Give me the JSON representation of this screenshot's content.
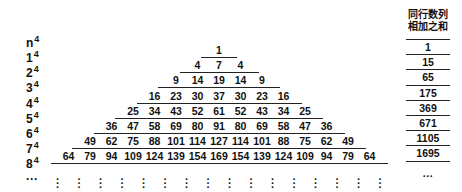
{
  "title_label": "n",
  "title_exp": "4",
  "header": {
    "line1": "同行数列",
    "line2": "相加之和"
  },
  "rows": [
    {
      "label": "1",
      "exp": "4",
      "values": [
        1
      ],
      "sum": "1"
    },
    {
      "label": "2",
      "exp": "4",
      "values": [
        4,
        7,
        4
      ],
      "sum": "15"
    },
    {
      "label": "3",
      "exp": "4",
      "values": [
        9,
        14,
        19,
        14,
        9
      ],
      "sum": "65"
    },
    {
      "label": "4",
      "exp": "4",
      "values": [
        16,
        23,
        30,
        37,
        30,
        23,
        16
      ],
      "sum": "175"
    },
    {
      "label": "5",
      "exp": "4",
      "values": [
        25,
        34,
        43,
        52,
        61,
        52,
        43,
        34,
        25
      ],
      "sum": "369"
    },
    {
      "label": "6",
      "exp": "4",
      "values": [
        36,
        47,
        58,
        69,
        80,
        91,
        80,
        69,
        58,
        47,
        36
      ],
      "sum": "671"
    },
    {
      "label": "7",
      "exp": "4",
      "values": [
        49,
        62,
        75,
        88,
        101,
        114,
        127,
        114,
        101,
        88,
        75,
        62,
        49
      ],
      "sum": "1105"
    },
    {
      "label": "8",
      "exp": "4",
      "values": [
        64,
        79,
        94,
        109,
        124,
        139,
        154,
        169,
        154,
        139,
        124,
        109,
        94,
        79,
        64
      ],
      "sum": "1695"
    }
  ],
  "continuation_label": "···",
  "continuation_sum": "···",
  "vdots": "⋮"
}
